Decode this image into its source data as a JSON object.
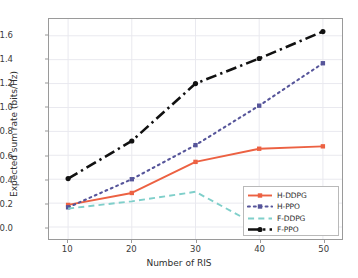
{
  "chart_data": {
    "type": "line",
    "title": "",
    "xlabel": "Number of RIS",
    "ylabel": "Expected sum rate (bits/Hz)",
    "x": [
      10,
      20,
      30,
      40,
      50
    ],
    "xticklabels": [
      "10",
      "20",
      "30",
      "40",
      "50"
    ],
    "yticklabels": [
      "0.0",
      "0.2",
      "0.4",
      "0.6",
      "0.8",
      "1.0",
      "1.2",
      "1.4",
      "1.6"
    ],
    "yticks": [
      0.0,
      0.2,
      0.4,
      0.6,
      0.8,
      1.0,
      1.2,
      1.4,
      1.6
    ],
    "xlim": [
      7,
      53
    ],
    "ylim": [
      -0.1,
      1.74
    ],
    "grid": true,
    "legend_position": "lower right",
    "series": [
      {
        "name": "H-DDPG",
        "values": [
          0.185,
          0.285,
          0.545,
          0.655,
          0.675
        ],
        "color": "#ec6142",
        "linestyle": "solid",
        "marker": "square"
      },
      {
        "name": "H-PPO",
        "values": [
          0.165,
          0.4,
          0.685,
          1.015,
          1.37
        ],
        "color": "#56559a",
        "linestyle": "dotted",
        "marker": "square"
      },
      {
        "name": "F-DDPG",
        "values": [
          0.155,
          0.215,
          0.295,
          0.005,
          0.01
        ],
        "color": "#7fcfca",
        "linestyle": "dashed",
        "marker": "none"
      },
      {
        "name": "F-PPO",
        "values": [
          0.405,
          0.72,
          1.2,
          1.41,
          1.635
        ],
        "color": "#111111",
        "linestyle": "dashdot",
        "marker": "circle"
      }
    ]
  }
}
